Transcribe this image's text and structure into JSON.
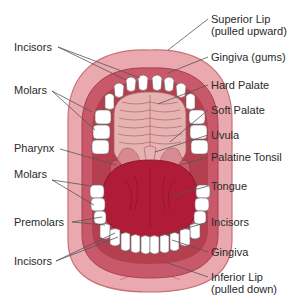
{
  "figure": {
    "colors": {
      "lip_outer": "#e9a9ae",
      "lip_edge": "#c96f78",
      "gingiva": "#c9596a",
      "gingiva_dark": "#b4404f",
      "palate": "#e7b3b2",
      "palate_ridges": "#a8646a",
      "tongue": "#b01c38",
      "teeth": "#ffffff",
      "leader_line": "#555555",
      "text": "#2a2a2a"
    }
  },
  "labels_left": [
    {
      "id": "incisors-upper",
      "text": "Incisors"
    },
    {
      "id": "molars-upper",
      "text": "Molars"
    },
    {
      "id": "pharynx",
      "text": "Pharynx"
    },
    {
      "id": "molars-lower",
      "text": "Molars"
    },
    {
      "id": "premolars",
      "text": "Premolars"
    },
    {
      "id": "incisors-lower",
      "text": "Incisors"
    }
  ],
  "labels_right": [
    {
      "id": "superior-lip",
      "line1": "Superior Lip",
      "line2": "(pulled upward)"
    },
    {
      "id": "gingiva-gums",
      "text": "Gingiva (gums)"
    },
    {
      "id": "hard-palate",
      "text": "Hard Palate"
    },
    {
      "id": "soft-palate",
      "text": "Soft Palate"
    },
    {
      "id": "uvula",
      "text": "Uvula"
    },
    {
      "id": "palatine-tonsil",
      "text": "Palatine Tonsil"
    },
    {
      "id": "tongue",
      "text": "Tongue"
    },
    {
      "id": "incisors-lower-right",
      "text": "Incisors"
    },
    {
      "id": "gingiva",
      "text": "Gingiva"
    },
    {
      "id": "inferior-lip",
      "line1": "Inferior Lip",
      "line2": "(pulled down)"
    }
  ]
}
